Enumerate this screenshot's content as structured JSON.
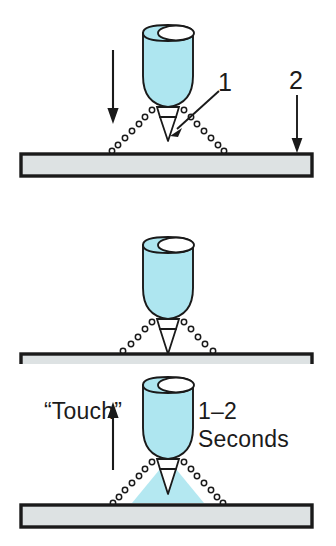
{
  "figure": {
    "kind": "technical-illustration",
    "panel_count": 3,
    "colors": {
      "torch_fill": "#AEE6F0",
      "plume_fill": "#AEE6F0",
      "workpiece_fill": "#DDE2E3",
      "outline": "#1a1a1a",
      "background": "#FFFFFF"
    }
  },
  "callouts": {
    "one": "1",
    "two": "2"
  },
  "panel1": {
    "name": "approach",
    "motion_arrow": "down-arrow",
    "callout_1_label": "1",
    "callout_1_target": "electrode-tip",
    "callout_2_label": "2",
    "callout_2_target": "workpiece"
  },
  "panel2": {
    "name": "touch",
    "touch_label": "“Touch”",
    "duration_value": "1–2",
    "duration_unit": "Seconds"
  },
  "panel3": {
    "name": "retract",
    "motion_arrow": "up-arrow",
    "plume": "plasma-arc-cone"
  }
}
